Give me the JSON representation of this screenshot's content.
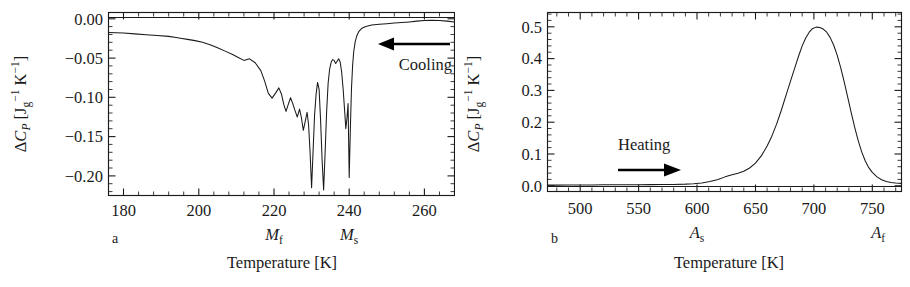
{
  "figure": {
    "panels": [
      {
        "letter": "a",
        "xlabel_main": "Temperature [K]",
        "ylabel_parts": {
          "delta": "Δ",
          "c": "C",
          "p": "P",
          "bracket_open": "[J",
          "g": "g",
          "exp1": "−1",
          "k": " K",
          "exp2": "−1",
          "bracket_close": "]"
        },
        "annotation": "Cooling",
        "arrow_direction": "left",
        "transition_labels": [
          {
            "base": "M",
            "sub": "f",
            "x_value": 220
          },
          {
            "base": "M",
            "sub": "s",
            "x_value": 240
          }
        ]
      },
      {
        "letter": "b",
        "xlabel_main": "Temperature [K]",
        "ylabel_parts": {
          "delta": "Δ",
          "c": "C",
          "p": "P",
          "bracket_open": "[J",
          "g": "g",
          "exp1": "−1",
          "k": " K",
          "exp2": "−1",
          "bracket_close": "]"
        },
        "annotation": "Heating",
        "arrow_direction": "right",
        "transition_labels": [
          {
            "base": "A",
            "sub": "s",
            "x_value": 600
          },
          {
            "base": "A",
            "sub": "f",
            "x_value": 755
          }
        ]
      }
    ]
  },
  "chart_data": [
    {
      "type": "line",
      "panel": "a",
      "title": "",
      "xlabel": "Temperature [K]",
      "ylabel": "ΔC_P [J g^-1 K^-1]",
      "xlim": [
        176,
        268
      ],
      "ylim": [
        -0.225,
        0.008
      ],
      "xticks": [
        180,
        200,
        220,
        240,
        260
      ],
      "xticklabels": [
        "180",
        "200",
        "220",
        "240",
        "260"
      ],
      "yticks": [
        0.0,
        -0.05,
        -0.1,
        -0.15,
        -0.2
      ],
      "yticklabels": [
        "0.00",
        "−0.05",
        "−0.10",
        "−0.15",
        "−0.20"
      ],
      "minor_ticks_between": 4,
      "grid": false,
      "legend": null,
      "annotations": [
        {
          "text": "Cooling",
          "x": 256,
          "y": -0.035
        },
        {
          "text": "M_f",
          "x": 220,
          "y": null
        },
        {
          "text": "M_s",
          "x": 240,
          "y": null
        }
      ],
      "series": [
        {
          "name": "Cooling DSC scan",
          "color": "#1a1a1a",
          "x": [
            176.0,
            178.0,
            180.0,
            183.0,
            186.0,
            189.0,
            192.0,
            194.0,
            195.5,
            197.0,
            199.0,
            201.0,
            203.0,
            205.0,
            207.0,
            209.0,
            210.5,
            212.0,
            213.5,
            215.0,
            216.5,
            217.5,
            218.5,
            219.5,
            220.5,
            221.3,
            222.0,
            222.6,
            223.2,
            223.8,
            224.4,
            225.0,
            225.6,
            226.2,
            226.8,
            227.3,
            227.8,
            228.3,
            228.8,
            229.2,
            229.6,
            230.0,
            230.4,
            230.8,
            231.2,
            231.6,
            232.0,
            232.4,
            232.8,
            233.2,
            233.6,
            234.0,
            234.4,
            234.8,
            235.2,
            235.6,
            236.0,
            236.4,
            236.8,
            237.2,
            237.6,
            238.0,
            238.4,
            238.8,
            239.1,
            239.4,
            239.7,
            240.0,
            240.3,
            240.6,
            240.9,
            241.2,
            241.6,
            242.0,
            242.6,
            243.4,
            244.4,
            246.0,
            248.0,
            250.0,
            252.0,
            254.0,
            256.0,
            258.0,
            260.0,
            262.0,
            264.0,
            266.0,
            268.0
          ],
          "y": [
            -0.0175,
            -0.0178,
            -0.0182,
            -0.0192,
            -0.0202,
            -0.0212,
            -0.0224,
            -0.0238,
            -0.025,
            -0.0262,
            -0.0278,
            -0.03,
            -0.033,
            -0.0368,
            -0.0412,
            -0.0455,
            -0.0492,
            -0.053,
            -0.051,
            -0.056,
            -0.066,
            -0.079,
            -0.095,
            -0.101,
            -0.094,
            -0.088,
            -0.096,
            -0.109,
            -0.118,
            -0.109,
            -0.1005,
            -0.108,
            -0.117,
            -0.125,
            -0.115,
            -0.126,
            -0.142,
            -0.131,
            -0.119,
            -0.135,
            -0.17,
            -0.215,
            -0.168,
            -0.122,
            -0.096,
            -0.081,
            -0.09,
            -0.13,
            -0.18,
            -0.218,
            -0.17,
            -0.118,
            -0.082,
            -0.064,
            -0.0555,
            -0.052,
            -0.053,
            -0.057,
            -0.054,
            -0.051,
            -0.055,
            -0.068,
            -0.09,
            -0.118,
            -0.14,
            -0.127,
            -0.108,
            -0.202,
            -0.142,
            -0.09,
            -0.06,
            -0.042,
            -0.029,
            -0.022,
            -0.016,
            -0.012,
            -0.0098,
            -0.008,
            -0.007,
            -0.0062,
            -0.0055,
            -0.0048,
            -0.004,
            -0.003,
            -0.0022,
            -0.0018,
            -0.0022,
            -0.003,
            -0.0042,
            -0.0058
          ]
        }
      ]
    },
    {
      "type": "line",
      "panel": "b",
      "title": "",
      "xlabel": "Temperature [K]",
      "ylabel": "ΔC_P [J g^-1 K^-1]",
      "xlim": [
        472,
        775
      ],
      "ylim": [
        -0.018,
        0.545
      ],
      "xticks": [
        500,
        550,
        600,
        650,
        700,
        750
      ],
      "xticklabels": [
        "500",
        "550",
        "600",
        "650",
        "700",
        "750"
      ],
      "yticks": [
        0.0,
        0.1,
        0.2,
        0.3,
        0.4,
        0.5
      ],
      "yticklabels": [
        "0.0",
        "0.1",
        "0.2",
        "0.3",
        "0.4",
        "0.5"
      ],
      "minor_ticks_between": 4,
      "grid": false,
      "legend": null,
      "annotations": [
        {
          "text": "Heating",
          "x": 560,
          "y": 0.115
        },
        {
          "text": "A_s",
          "x": 600,
          "y": null
        },
        {
          "text": "A_f",
          "x": 755,
          "y": null
        }
      ],
      "series": [
        {
          "name": "Heating DSC scan",
          "color": "#1a1a1a",
          "x": [
            472,
            480,
            490,
            500,
            510,
            520,
            530,
            540,
            550,
            560,
            570,
            580,
            590,
            597,
            604,
            611,
            618,
            624,
            630,
            635,
            640,
            645,
            650,
            655,
            660,
            664,
            668,
            672,
            676,
            680,
            684,
            687,
            690,
            693,
            696,
            699,
            702,
            705,
            708,
            711,
            714,
            717,
            720,
            723,
            726,
            729,
            732,
            735,
            738,
            741,
            744,
            747,
            750,
            754,
            758,
            762,
            766,
            770,
            775
          ],
          "y": [
            0.002,
            0.002,
            0.0022,
            0.0024,
            0.0026,
            0.003,
            0.0032,
            0.0034,
            0.0034,
            0.0036,
            0.0038,
            0.0042,
            0.0052,
            0.0065,
            0.009,
            0.0135,
            0.02,
            0.028,
            0.0345,
            0.0395,
            0.0455,
            0.056,
            0.071,
            0.094,
            0.125,
            0.156,
            0.193,
            0.236,
            0.283,
            0.329,
            0.375,
            0.409,
            0.44,
            0.465,
            0.483,
            0.495,
            0.499,
            0.498,
            0.493,
            0.483,
            0.466,
            0.442,
            0.41,
            0.371,
            0.326,
            0.278,
            0.229,
            0.183,
            0.141,
            0.106,
            0.078,
            0.057,
            0.042,
            0.028,
            0.019,
            0.0135,
            0.0105,
            0.0085,
            0.0075
          ]
        }
      ]
    }
  ]
}
